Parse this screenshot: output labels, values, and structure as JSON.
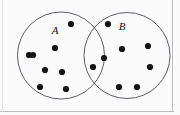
{
  "figure": {
    "type": "venn-diagram",
    "width": 180,
    "height": 115,
    "background_color": "#fbfbfb",
    "outline_color": "#5b5f66",
    "dot_color": "#141414",
    "frame_color": "#b9bcc0"
  },
  "sets": [
    {
      "key": "A",
      "label": "A",
      "label_x": 55,
      "label_y": 34,
      "circle": {
        "cx": 61,
        "cy": 55.5,
        "r": 43.5
      }
    },
    {
      "key": "B",
      "label": "B",
      "label_x": 122,
      "label_y": 30,
      "circle": {
        "cx": 127,
        "cy": 55.5,
        "r": 43.0
      }
    }
  ],
  "counts": {
    "only_a": 8,
    "intersection": 1,
    "only_b": 7,
    "total": 16
  },
  "dots": [
    {
      "region": "A",
      "x": 71,
      "y": 24
    },
    {
      "region": "A",
      "x": 55,
      "y": 48
    },
    {
      "region": "A",
      "x": 29,
      "y": 55
    },
    {
      "region": "A",
      "x": 45,
      "y": 70
    },
    {
      "region": "A",
      "x": 62,
      "y": 72
    },
    {
      "region": "A",
      "x": 40,
      "y": 87
    },
    {
      "region": "A",
      "x": 66,
      "y": 89
    },
    {
      "region": "A",
      "x": 33,
      "y": 55
    },
    {
      "region": "AB",
      "x": 93,
      "y": 67
    },
    {
      "region": "B",
      "x": 108,
      "y": 24
    },
    {
      "region": "B",
      "x": 122,
      "y": 49
    },
    {
      "region": "B",
      "x": 148,
      "y": 46
    },
    {
      "region": "B",
      "x": 150,
      "y": 67
    },
    {
      "region": "B",
      "x": 119,
      "y": 87
    },
    {
      "region": "B",
      "x": 137,
      "y": 87
    },
    {
      "region": "B",
      "x": 104,
      "y": 58
    }
  ],
  "dot_radius": 3.1
}
